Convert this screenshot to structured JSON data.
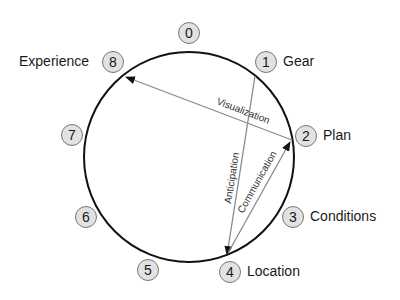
{
  "diagram": {
    "type": "circular-cycle",
    "nodes": [
      {
        "id": "0",
        "number": "0",
        "label": ""
      },
      {
        "id": "1",
        "number": "1",
        "label": "Gear"
      },
      {
        "id": "2",
        "number": "2",
        "label": "Plan"
      },
      {
        "id": "3",
        "number": "3",
        "label": "Conditions"
      },
      {
        "id": "4",
        "number": "4",
        "label": "Location"
      },
      {
        "id": "5",
        "number": "5",
        "label": ""
      },
      {
        "id": "6",
        "number": "6",
        "label": ""
      },
      {
        "id": "7",
        "number": "7",
        "label": ""
      },
      {
        "id": "8",
        "number": "8",
        "label": "Experience"
      }
    ],
    "edges": [
      {
        "from": "2",
        "to": "8",
        "label": "Visualization"
      },
      {
        "from": "1",
        "to": "4",
        "label": "Anticipation"
      },
      {
        "from": "4",
        "to": "2",
        "label": "Communication"
      }
    ],
    "colors": {
      "circle": "#111111",
      "edge": "#8a8a8a",
      "badge_fill": "#e2e2e2",
      "badge_border": "#777777"
    }
  }
}
